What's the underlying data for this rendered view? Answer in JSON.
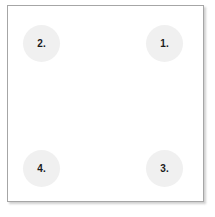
{
  "panel": {
    "background_color": "#ffffff",
    "border_color": "#a6a6a6",
    "shadow_color": "#787878"
  },
  "markers": {
    "fill_color": "#f0f0f0",
    "text_color": "#1b1b1b",
    "items": [
      {
        "id": "marker-1",
        "label": "1.",
        "position": "top-right"
      },
      {
        "id": "marker-2",
        "label": "2.",
        "position": "top-left"
      },
      {
        "id": "marker-3",
        "label": "3.",
        "position": "bottom-right"
      },
      {
        "id": "marker-4",
        "label": "4.",
        "position": "bottom-left"
      }
    ]
  }
}
